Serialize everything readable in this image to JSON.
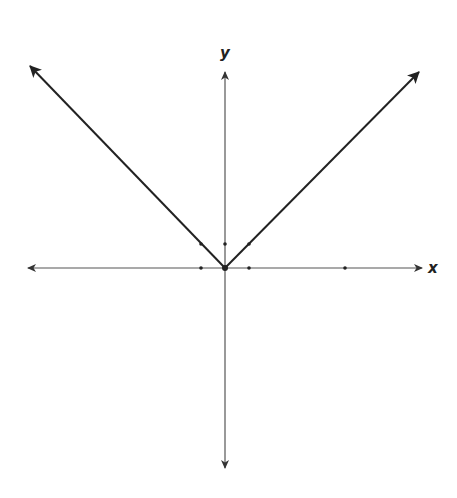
{
  "chart_data": {
    "type": "line",
    "title": "",
    "function": "y = |x|",
    "xlabel": "x",
    "ylabel": "y",
    "xlim": [
      -8,
      8
    ],
    "ylim": [
      -9,
      9
    ],
    "grid": false,
    "legend": null,
    "origin_px": [
      225,
      268
    ],
    "unit_px": 24,
    "series": [
      {
        "name": "y = |x|",
        "x": [
          -8,
          -1,
          0,
          1,
          8
        ],
        "y": [
          8,
          1,
          0,
          1,
          8
        ]
      }
    ],
    "marked_points": [
      {
        "x": -1,
        "y": 0
      },
      {
        "x": 1,
        "y": 0
      },
      {
        "x": 5,
        "y": 0
      },
      {
        "x": 0,
        "y": 1
      },
      {
        "x": -1,
        "y": 1
      },
      {
        "x": 1,
        "y": 1
      },
      {
        "x": 0,
        "y": 0
      }
    ]
  },
  "labels": {
    "x_axis": "x",
    "y_axis": "y"
  },
  "colors": {
    "axis": "#555555",
    "curve": "#222222",
    "background": "#ffffff"
  }
}
